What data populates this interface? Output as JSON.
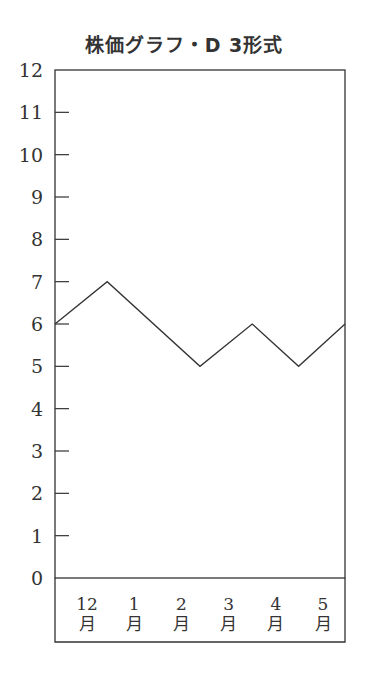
{
  "chart_data": {
    "type": "line",
    "title": "株価グラフ・D 3形式",
    "xlabel": "",
    "ylabel": "",
    "categories": [
      "12月",
      "1月",
      "2月",
      "3月",
      "4月",
      "5月"
    ],
    "category_lines": [
      [
        "12",
        "月"
      ],
      [
        "1",
        "月"
      ],
      [
        "2",
        "月"
      ],
      [
        "3",
        "月"
      ],
      [
        "4",
        "月"
      ],
      [
        "5",
        "月"
      ]
    ],
    "points": [
      {
        "x_frac": 0.0,
        "y": 6
      },
      {
        "x_frac": 0.18,
        "y": 7
      },
      {
        "x_frac": 0.5,
        "y": 5
      },
      {
        "x_frac": 0.68,
        "y": 6
      },
      {
        "x_frac": 0.84,
        "y": 5
      },
      {
        "x_frac": 1.0,
        "y": 6
      }
    ],
    "y_ticks": [
      0,
      1,
      2,
      3,
      4,
      5,
      6,
      7,
      8,
      9,
      10,
      11,
      12
    ],
    "ylim": [
      0,
      12
    ],
    "grid": false,
    "legend": null
  },
  "style": {
    "line_color": "#333333",
    "axis_color": "#333333"
  }
}
